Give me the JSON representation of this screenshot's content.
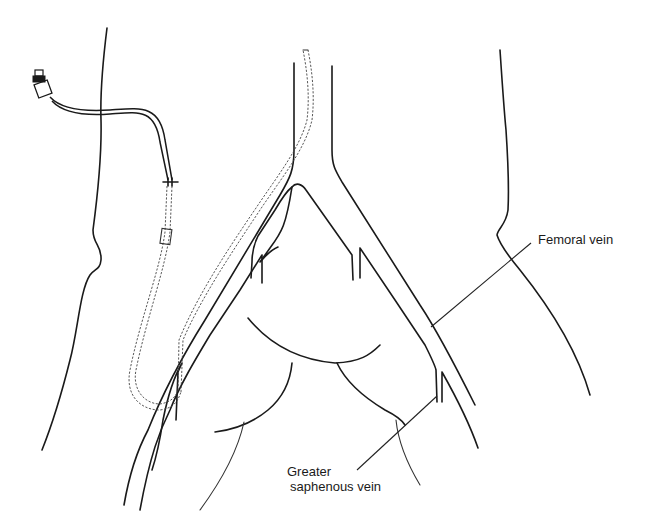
{
  "figure": {
    "type": "anatomical line illustration"
  },
  "labels": {
    "femoral_vein": "Femoral vein",
    "greater_saphenous_vein_line1": "Greater",
    "greater_saphenous_vein_line2": "saphenous vein"
  },
  "colors": {
    "background": "#ffffff",
    "line": "#1a1a1a"
  }
}
